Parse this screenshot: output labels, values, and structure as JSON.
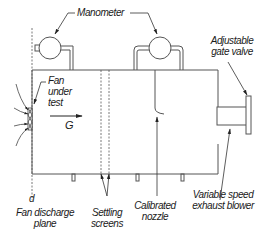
{
  "diagram": {
    "colors": {
      "line": "#333333",
      "background": "#ffffff",
      "text": "#1a1a1a"
    },
    "labels": {
      "manometer": "Manometer",
      "gate_valve_line1": "Adjustable",
      "gate_valve_line2": "gate valve",
      "fan_line1": "Fan",
      "fan_line2": "under",
      "fan_line3": "test",
      "flow_symbol": "G",
      "plane_symbol": "d",
      "discharge_line1": "Fan discharge",
      "discharge_line2": "plane",
      "screens_line1": "Settling",
      "screens_line2": "screens",
      "nozzle_line1": "Calibrated",
      "nozzle_line2": "nozzle",
      "blower_line1": "Variable speed",
      "blower_line2": "exhaust blower"
    },
    "components": [
      "manometer-left",
      "manometer-right",
      "test-chamber",
      "fan-under-test",
      "settling-screens",
      "calibrated-nozzle",
      "exhaust-blower",
      "gate-valve",
      "fan-discharge-plane"
    ]
  }
}
